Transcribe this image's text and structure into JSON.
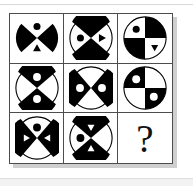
{
  "puzzle": {
    "title": "Matrix reasoning 3x3 figure puzzle",
    "grid_rows": 3,
    "grid_cols": 3,
    "missing_cell_label": "?",
    "colors": {
      "ink": "#000000",
      "paper": "#ffffff",
      "grid_line": "#4d4d4d",
      "shadow": "#cfcfcf",
      "page_rule": "#d9d9d9"
    },
    "cells": [
      {
        "id": "cell-1",
        "position": "row1-col1",
        "description": "Black circle with white vertical bowtie; black dot in upper white wedge, black triangle in lower white wedge",
        "shape": "circle",
        "partition": "vertical-bowtie",
        "disc_fill": "black",
        "wedge_fill": "white",
        "marks": [
          {
            "slot": "top",
            "glyph": "dot",
            "fill": "black"
          },
          {
            "slot": "bottom",
            "glyph": "triangle-up",
            "fill": "black"
          }
        ]
      },
      {
        "id": "cell-2",
        "position": "row1-col2",
        "description": "White circle with black vertical bowtie; black dot in left white wedge, black triangle in right white wedge",
        "shape": "circle",
        "partition": "vertical-bowtie",
        "disc_fill": "white",
        "wedge_fill": "black",
        "marks": [
          {
            "slot": "left",
            "glyph": "dot",
            "fill": "black"
          },
          {
            "slot": "right",
            "glyph": "triangle-right",
            "fill": "black"
          }
        ]
      },
      {
        "id": "cell-3",
        "position": "row1-col3",
        "description": "Circle in four quadrants; top-right and bottom-left black; black dot in white top-left, black triangle in white bottom-right",
        "shape": "circle",
        "partition": "quadrants",
        "disc_fill": "white",
        "wedge_fill": "black",
        "marks": [
          {
            "slot": "top-left",
            "glyph": "dot",
            "fill": "black"
          },
          {
            "slot": "bottom-right",
            "glyph": "triangle-down",
            "fill": "black"
          }
        ]
      },
      {
        "id": "cell-4",
        "position": "row2-col1",
        "description": "White circle with black vertical bowtie; white dot in upper black wedge and white dot in lower black wedge",
        "shape": "circle",
        "partition": "vertical-bowtie",
        "disc_fill": "white",
        "wedge_fill": "black",
        "marks": [
          {
            "slot": "top",
            "glyph": "dot",
            "fill": "white"
          },
          {
            "slot": "bottom",
            "glyph": "dot",
            "fill": "white"
          }
        ]
      },
      {
        "id": "cell-5",
        "position": "row2-col2",
        "description": "White circle with black horizontal bowtie; white dot in left black wedge and white dot in right black wedge",
        "shape": "circle",
        "partition": "horizontal-bowtie",
        "disc_fill": "white",
        "wedge_fill": "black",
        "marks": [
          {
            "slot": "left",
            "glyph": "dot",
            "fill": "white"
          },
          {
            "slot": "right",
            "glyph": "dot",
            "fill": "white"
          }
        ]
      },
      {
        "id": "cell-6",
        "position": "row2-col3",
        "description": "Circle in four quadrants; top-left and bottom-right black, each containing a white dot",
        "shape": "circle",
        "partition": "quadrants",
        "disc_fill": "white",
        "wedge_fill": "black",
        "marks": [
          {
            "slot": "top-left",
            "glyph": "dot",
            "fill": "white"
          },
          {
            "slot": "bottom-right",
            "glyph": "dot",
            "fill": "white"
          }
        ]
      },
      {
        "id": "cell-7",
        "position": "row3-col1",
        "description": "White circle with black horizontal bowtie; black dot in upper white wedge, white triangles inside left and right black wedges",
        "shape": "circle",
        "partition": "horizontal-bowtie",
        "disc_fill": "white",
        "wedge_fill": "black",
        "marks": [
          {
            "slot": "top",
            "glyph": "dot",
            "fill": "black"
          },
          {
            "slot": "left",
            "glyph": "triangle-right",
            "fill": "white"
          },
          {
            "slot": "right",
            "glyph": "triangle-left",
            "fill": "white"
          }
        ]
      },
      {
        "id": "cell-8",
        "position": "row3-col2",
        "description": "White circle with black vertical bowtie; black dot in left white wedge, white triangles inside top and bottom black wedges",
        "shape": "circle",
        "partition": "vertical-bowtie",
        "disc_fill": "white",
        "wedge_fill": "black",
        "marks": [
          {
            "slot": "left",
            "glyph": "dot",
            "fill": "black"
          },
          {
            "slot": "top",
            "glyph": "triangle-down",
            "fill": "white"
          },
          {
            "slot": "bottom",
            "glyph": "triangle-up",
            "fill": "white"
          }
        ]
      },
      {
        "id": "cell-9",
        "position": "row3-col3",
        "description": "Empty cell containing a large question mark marking the missing figure",
        "shape": "question-mark",
        "partition": "none",
        "disc_fill": "none",
        "wedge_fill": "none",
        "marks": []
      }
    ]
  }
}
